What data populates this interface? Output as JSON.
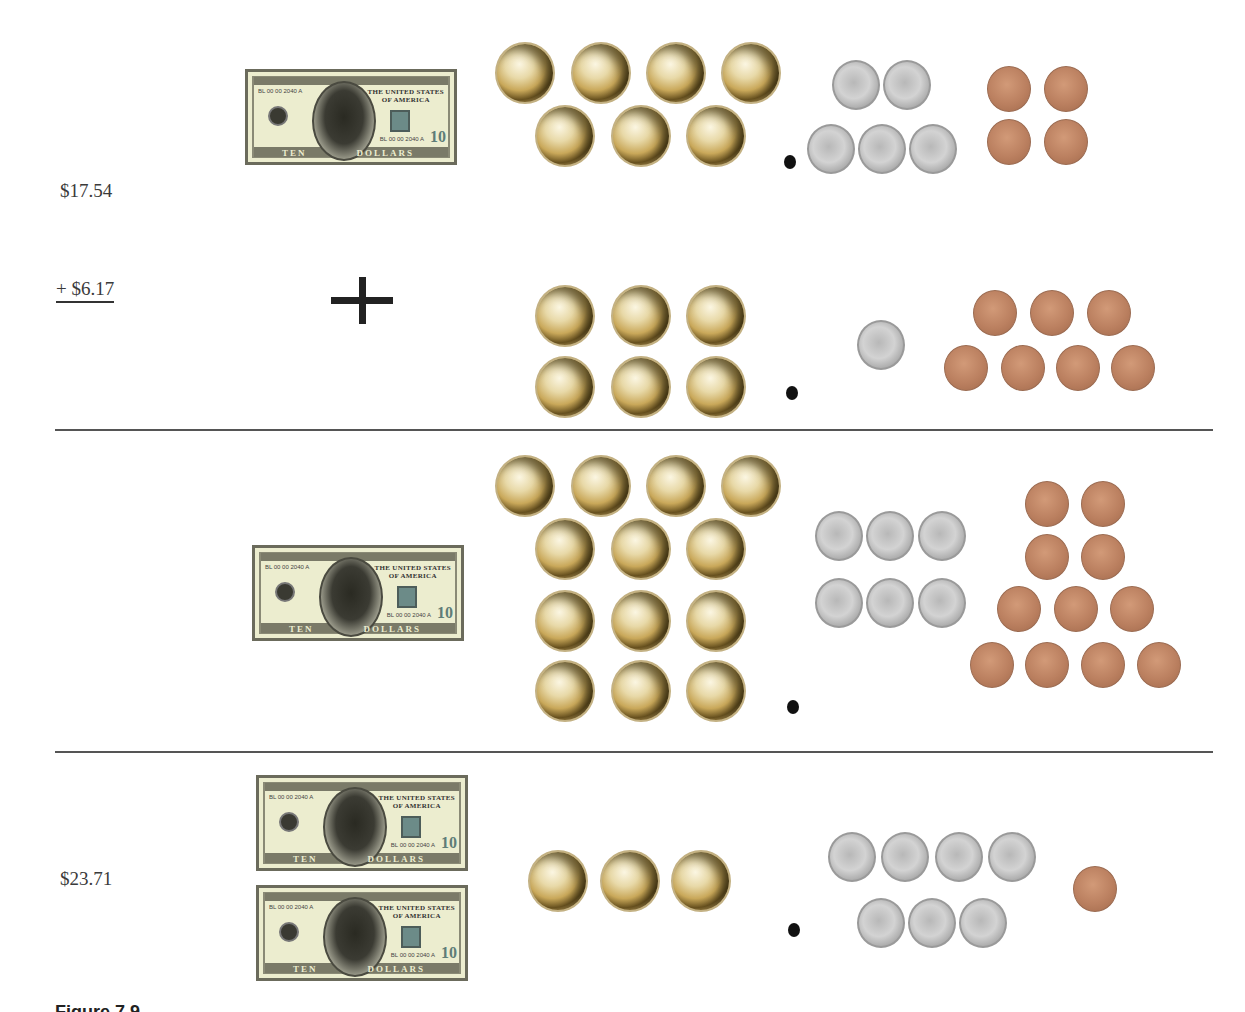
{
  "figure": {
    "caption_partial": "Figure 7.9",
    "operation": "addition",
    "rows": [
      {
        "name": "addend-1",
        "label": "$17.54",
        "ten_dollar_bills": 1,
        "dollar_coins": 7,
        "decimal_point": true,
        "dimes": 5,
        "pennies": 4
      },
      {
        "name": "addend-2",
        "label": "+ $6.17",
        "operator_symbol": "+",
        "ten_dollar_bills": 0,
        "dollar_coins": 6,
        "decimal_point": true,
        "dimes": 1,
        "pennies": 7
      },
      {
        "name": "combined",
        "label": "",
        "ten_dollar_bills": 1,
        "dollar_coins": 13,
        "decimal_point": true,
        "dimes": 6,
        "pennies": 11
      },
      {
        "name": "sum",
        "label": "$23.71",
        "ten_dollar_bills": 2,
        "dollar_coins": 3,
        "decimal_point": true,
        "dimes": 7,
        "pennies": 1
      }
    ]
  },
  "bill": {
    "denomination": "10",
    "title_line1": "THE UNITED STATES",
    "title_line2": "OF AMERICA",
    "serial": "BL 00 00 2040 A",
    "word_left": "TEN",
    "word_right": "DOLLARS"
  },
  "colors": {
    "dollar_coin": "#c9a85a",
    "dime": "#c8c8c8",
    "penny": "#bb8060",
    "bill_paper": "#ecedcf",
    "divider": "#555555"
  }
}
